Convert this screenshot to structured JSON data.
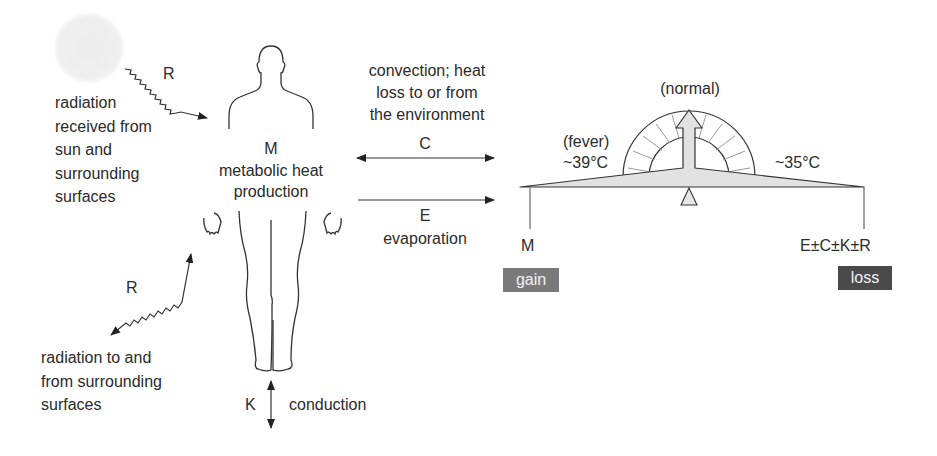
{
  "diagram": {
    "sun": {
      "symbol": "R",
      "label_lines": [
        "radiation",
        "received from",
        "sun and",
        "surrounding",
        "surfaces"
      ]
    },
    "body": {
      "symbol": "M",
      "label_lines": [
        "metabolic heat",
        "production"
      ]
    },
    "radiation_exchange": {
      "symbol": "R",
      "label_lines": [
        "radiation to and",
        "from surrounding",
        "surfaces"
      ]
    },
    "convection": {
      "label_lines": [
        "convection; heat",
        "loss to or from",
        "the environment"
      ],
      "symbol": "C"
    },
    "evaporation": {
      "symbol": "E",
      "label": "evaporation"
    },
    "conduction": {
      "symbol": "K",
      "label": "conduction"
    },
    "balance": {
      "normal_label": "(normal)",
      "fever_label": "(fever)",
      "fever_temp": "~39°C",
      "low_temp": "~35°C",
      "left_symbol": "M",
      "right_symbol": "E±C±K±R",
      "gain_label": "gain",
      "loss_label": "loss",
      "colors": {
        "gain": "#7a7a7a",
        "loss": "#4a4a4a",
        "beam_fill": "#e2e2e2",
        "sun": "#ececec"
      }
    }
  }
}
